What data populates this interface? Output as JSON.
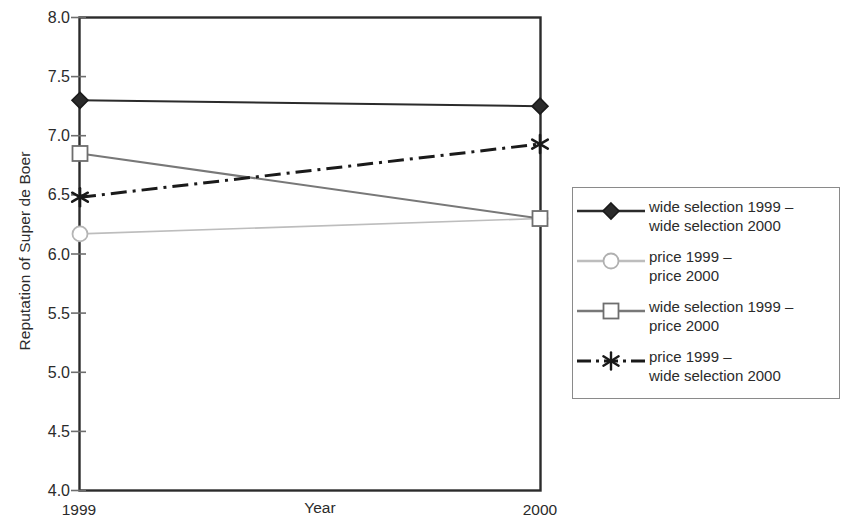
{
  "chart_data": {
    "type": "line",
    "title": "",
    "xlabel": "Year",
    "ylabel": "Reputation of Super de Boer",
    "categories": [
      "1999",
      "2000"
    ],
    "x": [
      1999,
      2000
    ],
    "ylim": [
      4.0,
      8.0
    ],
    "yticks": [
      "4.0",
      "4.5",
      "5.0",
      "5.5",
      "6.0",
      "6.5",
      "7.0",
      "7.5",
      "8.0"
    ],
    "ytick_values": [
      4.0,
      4.5,
      5.0,
      5.5,
      6.0,
      6.5,
      7.0,
      7.5,
      8.0
    ],
    "grid": false,
    "legend_position": "right",
    "series": [
      {
        "name": "wide selection 1999 –\nwide selection 2000",
        "values": [
          7.3,
          7.25
        ],
        "marker": "diamond",
        "linestyle": "solid",
        "color": "#2b2b2b"
      },
      {
        "name": "price 1999 –\nprice 2000",
        "values": [
          6.17,
          6.3
        ],
        "marker": "circle",
        "linestyle": "solid",
        "color": "#bdbdbd"
      },
      {
        "name": "wide selection 1999 –\nprice 2000",
        "values": [
          6.85,
          6.3
        ],
        "marker": "square",
        "linestyle": "solid",
        "color": "#787878"
      },
      {
        "name": "price 1999 –\nwide selection 2000",
        "values": [
          6.48,
          6.93
        ],
        "marker": "asterisk",
        "linestyle": "dashdot",
        "color": "#1a1a1a"
      }
    ]
  },
  "axes": {
    "y_title": "Reputation of Super de Boer",
    "x_title": "Year",
    "y_tick_labels": [
      "8.0",
      "7.5",
      "7.0",
      "6.5",
      "6.0",
      "5.5",
      "5.0",
      "4.5",
      "4.0"
    ],
    "x_tick_labels": [
      "1999",
      "2000"
    ]
  },
  "legend": {
    "items": [
      {
        "label": "wide selection 1999 –\nwide selection 2000",
        "marker": "diamond-icon",
        "color": "#2b2b2b"
      },
      {
        "label": "price 1999 –\nprice 2000",
        "marker": "circle-icon",
        "color": "#bdbdbd"
      },
      {
        "label": "wide selection 1999 –\nprice 2000",
        "marker": "square-icon",
        "color": "#787878"
      },
      {
        "label": "price 1999 –\nwide selection 2000",
        "marker": "asterisk-icon",
        "color": "#1a1a1a"
      }
    ]
  },
  "colors": {
    "axis": "#2b2b2b",
    "series_dark": "#2b2b2b",
    "series_light_gray": "#bdbdbd",
    "series_mid_gray": "#787878",
    "series_black": "#1a1a1a",
    "legend_border": "#8a8a8a",
    "background": "#ffffff"
  }
}
